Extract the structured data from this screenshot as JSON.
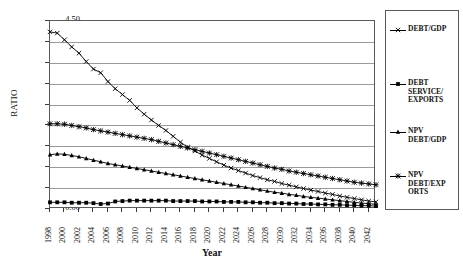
{
  "chart_data": {
    "type": "line",
    "title": "",
    "xlabel": "Year",
    "ylabel": "RATIO",
    "ylim": [
      0.0,
      4.5
    ],
    "ytick_step": 0.5,
    "ytick_labels": [
      "0.00",
      "0.50",
      "1.00",
      "1.50",
      "2.00",
      "2.50",
      "3.00",
      "3.50",
      "4.00",
      "4.50"
    ],
    "ytick_values": [
      0.0,
      0.5,
      1.0,
      1.5,
      2.0,
      2.5,
      3.0,
      3.5,
      4.0,
      4.5
    ],
    "grid": "horizontal",
    "legend_position": "right",
    "x": [
      1998,
      1999,
      2000,
      2001,
      2002,
      2003,
      2004,
      2005,
      2006,
      2007,
      2008,
      2009,
      2010,
      2011,
      2012,
      2013,
      2014,
      2015,
      2016,
      2017,
      2018,
      2019,
      2020,
      2021,
      2022,
      2023,
      2024,
      2025,
      2026,
      2027,
      2028,
      2029,
      2030,
      2031,
      2032,
      2033,
      2034,
      2035,
      2036,
      2037,
      2038,
      2039,
      2040,
      2041,
      2042,
      2043
    ],
    "xtick_labels": [
      "1998",
      "2000",
      "2002",
      "2004",
      "2006",
      "2008",
      "2010",
      "2012",
      "2014",
      "2016",
      "2018",
      "2020",
      "2022",
      "2024",
      "2026",
      "2028",
      "2030",
      "2032",
      "2034",
      "2036",
      "2038",
      "2040",
      "2042"
    ],
    "series": [
      {
        "name": "DEBT/GDP",
        "marker": "cross",
        "values": [
          4.24,
          4.21,
          4.05,
          3.88,
          3.73,
          3.53,
          3.35,
          3.26,
          3.05,
          2.88,
          2.74,
          2.6,
          2.42,
          2.27,
          2.13,
          2.0,
          1.88,
          1.74,
          1.6,
          1.48,
          1.39,
          1.29,
          1.21,
          1.13,
          1.05,
          0.98,
          0.92,
          0.86,
          0.8,
          0.75,
          0.7,
          0.66,
          0.61,
          0.57,
          0.53,
          0.49,
          0.45,
          0.42,
          0.38,
          0.35,
          0.31,
          0.28,
          0.25,
          0.22,
          0.19,
          0.17
        ]
      },
      {
        "name": "DEBT SERVICE/EXPORTS",
        "marker": "square",
        "values": [
          0.16,
          0.16,
          0.16,
          0.15,
          0.15,
          0.15,
          0.14,
          0.12,
          0.13,
          0.18,
          0.19,
          0.2,
          0.2,
          0.2,
          0.2,
          0.2,
          0.2,
          0.19,
          0.19,
          0.19,
          0.19,
          0.18,
          0.18,
          0.18,
          0.17,
          0.17,
          0.17,
          0.16,
          0.16,
          0.15,
          0.15,
          0.14,
          0.14,
          0.13,
          0.13,
          0.12,
          0.12,
          0.11,
          0.11,
          0.1,
          0.1,
          0.09,
          0.09,
          0.08,
          0.08,
          0.07
        ]
      },
      {
        "name": "NPV DEBT/GDP",
        "marker": "triangle",
        "values": [
          1.3,
          1.32,
          1.31,
          1.28,
          1.25,
          1.21,
          1.17,
          1.13,
          1.09,
          1.06,
          1.03,
          1.0,
          0.97,
          0.94,
          0.91,
          0.88,
          0.85,
          0.82,
          0.79,
          0.76,
          0.73,
          0.7,
          0.67,
          0.64,
          0.61,
          0.58,
          0.55,
          0.52,
          0.49,
          0.46,
          0.43,
          0.4,
          0.38,
          0.35,
          0.33,
          0.3,
          0.28,
          0.26,
          0.24,
          0.22,
          0.2,
          0.18,
          0.16,
          0.14,
          0.13,
          0.11
        ]
      },
      {
        "name": "NPV DEBT/EXPORTS",
        "marker": "star",
        "values": [
          2.04,
          2.04,
          2.03,
          2.0,
          1.97,
          1.94,
          1.9,
          1.87,
          1.84,
          1.81,
          1.78,
          1.75,
          1.72,
          1.69,
          1.66,
          1.62,
          1.58,
          1.54,
          1.5,
          1.46,
          1.42,
          1.38,
          1.34,
          1.3,
          1.26,
          1.22,
          1.18,
          1.14,
          1.1,
          1.06,
          1.02,
          0.98,
          0.95,
          0.91,
          0.88,
          0.85,
          0.82,
          0.79,
          0.76,
          0.73,
          0.7,
          0.67,
          0.64,
          0.62,
          0.6,
          0.58
        ]
      }
    ]
  },
  "legend": {
    "entries": [
      {
        "label": "DEBT/GDP"
      },
      {
        "label": "DEBT SERVICE/ EXPORTS"
      },
      {
        "label": "NPV DEBT/GDP"
      },
      {
        "label": "NPV DEBT/EXP ORTS"
      }
    ]
  },
  "colors": {
    "line": "#000000",
    "grid": "#9a9a9a",
    "axis": "#5a5a5a",
    "background": "#ffffff"
  }
}
